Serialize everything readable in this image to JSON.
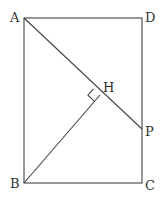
{
  "diagram": {
    "type": "geometry",
    "points": {
      "A": {
        "label": "A",
        "x": 24,
        "y": 18
      },
      "D": {
        "label": "D",
        "x": 142,
        "y": 18
      },
      "B": {
        "label": "B",
        "x": 24,
        "y": 183
      },
      "C": {
        "label": "C",
        "x": 142,
        "y": 183
      },
      "P": {
        "label": "P",
        "x": 142,
        "y": 129
      },
      "H": {
        "label": "H",
        "x": 100,
        "y": 95
      }
    },
    "segments": [
      "AD",
      "DC",
      "CB",
      "BA",
      "AP",
      "BH"
    ],
    "right_angle_at": "H",
    "line_color": "#444444",
    "label_color": "#333333"
  }
}
